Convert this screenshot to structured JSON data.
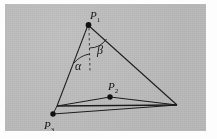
{
  "figure": {
    "type": "geometry-diagram",
    "background_color": "#b9b9b9",
    "page_color": "#fdfdfd",
    "stroke_color": "#1a1a1a",
    "points": [
      {
        "id": "P1",
        "label": "P",
        "subscript": "1",
        "x": 88,
        "y": 25,
        "role": "apex-vertex"
      },
      {
        "id": "P2",
        "label": "P",
        "subscript": "2",
        "x": 110,
        "y": 97,
        "role": "interior-point"
      },
      {
        "id": "P3",
        "label": "P",
        "subscript": "3",
        "x": 53,
        "y": 114,
        "role": "lower-left-point"
      },
      {
        "id": "V_left",
        "label": "",
        "subscript": "",
        "x": 57,
        "y": 106,
        "role": "left-vertex"
      },
      {
        "id": "V_right",
        "label": "",
        "subscript": "",
        "x": 177,
        "y": 105,
        "role": "right-vertex"
      }
    ],
    "angles": [
      {
        "id": "alpha",
        "symbol": "α",
        "x": 74,
        "y": 62,
        "side": "left-of-dashed-axis"
      },
      {
        "id": "beta",
        "symbol": "β",
        "x": 96,
        "y": 46,
        "side": "right-of-dashed-axis"
      }
    ],
    "segments": [
      {
        "from": "P1",
        "to": "V_left"
      },
      {
        "from": "P1",
        "to": "V_right"
      },
      {
        "from": "V_left",
        "to": "V_right"
      },
      {
        "from": "V_left",
        "to": "P2"
      },
      {
        "from": "P2",
        "to": "V_right"
      },
      {
        "from": "V_left",
        "to": "P3"
      },
      {
        "from": "P3",
        "to": "V_right"
      }
    ],
    "dashed_axis": {
      "from_x": 88,
      "from_y": 25,
      "to_x": 89,
      "to_y": 72,
      "style": "dashed"
    }
  }
}
